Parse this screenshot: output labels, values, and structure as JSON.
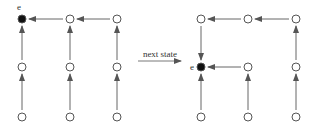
{
  "diagram": {
    "transition_label": "next state",
    "node_label": "e",
    "colors": {
      "edge": "#666666",
      "node_stroke": "#555555",
      "node_fill": "#ffffff",
      "active_fill": "#111111"
    },
    "left_state": {
      "nodes": [
        {
          "id": "a1",
          "x": 22,
          "y": 19,
          "active": true
        },
        {
          "id": "b1",
          "x": 70,
          "y": 19
        },
        {
          "id": "c1",
          "x": 117,
          "y": 19
        },
        {
          "id": "a2",
          "x": 22,
          "y": 67
        },
        {
          "id": "b2",
          "x": 70,
          "y": 67
        },
        {
          "id": "c2",
          "x": 117,
          "y": 67
        },
        {
          "id": "a3",
          "x": 22,
          "y": 117
        },
        {
          "id": "b3",
          "x": 70,
          "y": 117
        },
        {
          "id": "c3",
          "x": 117,
          "y": 117
        }
      ],
      "edges": [
        [
          "b1",
          "a1"
        ],
        [
          "c1",
          "b1"
        ],
        [
          "a2",
          "a1"
        ],
        [
          "b2",
          "b1"
        ],
        [
          "c2",
          "c1"
        ],
        [
          "a3",
          "a2"
        ],
        [
          "b3",
          "b2"
        ],
        [
          "c3",
          "c2"
        ]
      ]
    },
    "right_state": {
      "nodes": [
        {
          "id": "a1",
          "x": 201,
          "y": 19
        },
        {
          "id": "b1",
          "x": 248,
          "y": 19
        },
        {
          "id": "c1",
          "x": 296,
          "y": 19
        },
        {
          "id": "a2",
          "x": 201,
          "y": 67,
          "active": true
        },
        {
          "id": "b2",
          "x": 248,
          "y": 67
        },
        {
          "id": "c2",
          "x": 296,
          "y": 67
        },
        {
          "id": "a3",
          "x": 201,
          "y": 117
        },
        {
          "id": "b3",
          "x": 248,
          "y": 117
        },
        {
          "id": "c3",
          "x": 296,
          "y": 117
        }
      ],
      "edges": [
        [
          "b1",
          "a1"
        ],
        [
          "c1",
          "b1"
        ],
        [
          "a1",
          "a2"
        ],
        [
          "b2",
          "a2"
        ],
        [
          "c2",
          "c1"
        ],
        [
          "a3",
          "a2"
        ],
        [
          "b3",
          "b2"
        ],
        [
          "c3",
          "c2"
        ]
      ]
    }
  }
}
